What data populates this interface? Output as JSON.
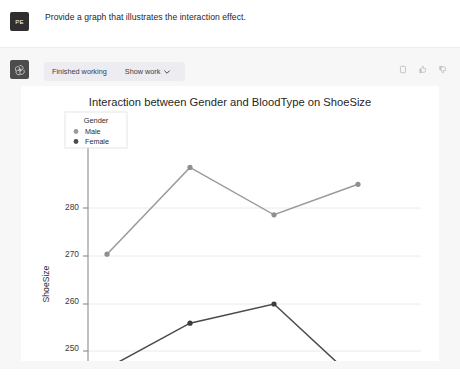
{
  "conversation": {
    "user": {
      "avatar_initials": "PE",
      "avatar_name": "user-avatar",
      "message": "Provide a graph that illustrates the interaction effect."
    },
    "assistant": {
      "avatar_name": "assistant-avatar-logo",
      "status_label": "Finished working",
      "show_work_label": "Show work",
      "chevron_icon": "chevron-down-icon",
      "actions": [
        {
          "name": "copy-icon",
          "label": "Copy"
        },
        {
          "name": "thumbs-up-icon",
          "label": "Good response"
        },
        {
          "name": "thumbs-down-icon",
          "label": "Bad response"
        }
      ]
    }
  },
  "chart_data": {
    "type": "line",
    "title": "Interaction between Gender and BloodType on ShoeSize",
    "xlabel": "BloodType",
    "ylabel": "ShoeSize",
    "categories": [
      "A",
      "O",
      "B",
      "AB"
    ],
    "ylim": [
      241.5,
      290.5
    ],
    "yticks": [
      250,
      260,
      270,
      280
    ],
    "ytick_labels": [
      "250",
      "260",
      "270",
      "280"
    ],
    "grid": true,
    "legend": {
      "title": "Gender",
      "position": "upper-left",
      "entries": [
        {
          "name": "Male",
          "color": "#9a9a9a"
        },
        {
          "name": "Female",
          "color": "#4a4a4a"
        }
      ]
    },
    "series": [
      {
        "name": "Male",
        "color": "#9a9a9a",
        "values": [
          270.0,
          288.5,
          278.4,
          284.9
        ]
      },
      {
        "name": "Female",
        "color": "#4a4a4a",
        "values": [
          245.7,
          255.3,
          259.4,
          242.8
        ]
      }
    ]
  },
  "colors": {
    "page_background": "#ffffff",
    "assistant_background": "#f7f7f8",
    "workbar_background": "#ececf1",
    "text_primary": "#262626",
    "male_series": "#9a9a9a",
    "female_series": "#4a4a4a"
  }
}
